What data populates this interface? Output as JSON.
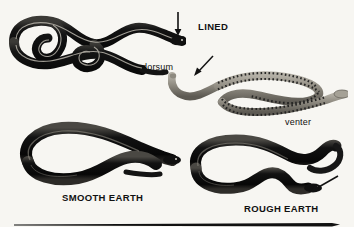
{
  "plate": {
    "background_color": "#f7f6f2",
    "ink_color": "#111111",
    "width": 354,
    "height": 227
  },
  "labels": {
    "lined": "LINED",
    "dorsum": "dorsum",
    "venter": "venter",
    "smooth_earth": "SMOOTH EARTH",
    "rough_earth": "ROUGH EARTH"
  },
  "figures": [
    {
      "name": "lined-snake-dorsum",
      "label": "LINED",
      "view": "dorsum",
      "description": "dark coiled snake with pale longitudinal stripes",
      "body_color": "#1a1a1a",
      "stripe_color": "#c9c6bd"
    },
    {
      "name": "lined-snake-venter",
      "label": "venter",
      "view": "venter",
      "description": "pale grey belly with paired dark half-moon spots",
      "body_color": "#9a968c",
      "spot_color": "#1d1d1d"
    },
    {
      "name": "smooth-earth-snake",
      "label": "SMOOTH EARTH",
      "view": "dorsum",
      "description": "uniform dark unpatterned snake in a broad loop",
      "body_color": "#141414"
    },
    {
      "name": "rough-earth-snake",
      "label": "ROUGH EARTH",
      "view": "dorsum",
      "description": "uniform dark unpatterned snake in an S coil",
      "body_color": "#141414"
    }
  ],
  "pointers": [
    {
      "name": "arrow-to-lined-head",
      "direction": "down",
      "target": "LINED"
    },
    {
      "name": "arrow-to-venter",
      "direction": "down-left",
      "target": "venter"
    },
    {
      "name": "arrow-to-rough-earth-head",
      "direction": "down-left",
      "target": "ROUGH EARTH"
    }
  ],
  "rule": {
    "name": "bottom-divider-rule",
    "color": "#111111"
  }
}
